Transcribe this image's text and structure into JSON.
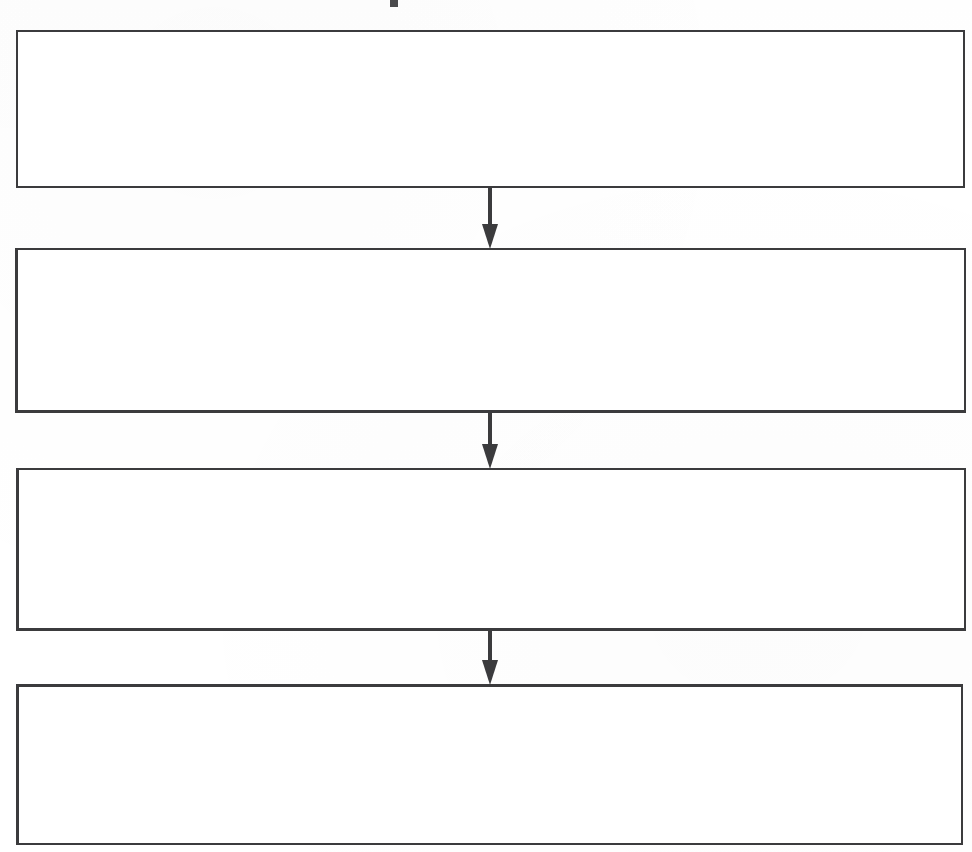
{
  "document": {
    "kind": "flowchart",
    "title": "",
    "orientation": "vertical",
    "background_color": "#ffffff",
    "line_color": "#3b3b3d",
    "node_fill": "#ffffff",
    "page_width": 972,
    "page_height": 852
  },
  "title_fragment": {
    "name": "clipped-title-glyph",
    "text": "",
    "note": "truncated dark glyph fragment at top edge",
    "x": 390,
    "y": 0,
    "width": 8,
    "height": 7,
    "color": "#4a4a4c"
  },
  "flowchart": {
    "node_count": 4,
    "connector_count": 3,
    "nodes": [
      {
        "id": "node-1",
        "name": "process-box-1",
        "label": "",
        "order": 1,
        "x": 16,
        "y": 30,
        "width": 949,
        "height": 158
      },
      {
        "id": "node-2",
        "name": "process-box-2",
        "label": "",
        "order": 2,
        "x": 15,
        "y": 248,
        "width": 951,
        "height": 165
      },
      {
        "id": "node-3",
        "name": "process-box-3",
        "label": "",
        "order": 3,
        "x": 16,
        "y": 468,
        "width": 950,
        "height": 163
      },
      {
        "id": "node-4",
        "name": "process-box-4",
        "label": "",
        "order": 4,
        "x": 16,
        "y": 684,
        "width": 947,
        "height": 161
      }
    ],
    "connectors": [
      {
        "id": "connector-1",
        "name": "arrow-node1-to-node2",
        "from": "node-1",
        "to": "node-2",
        "label": "",
        "direction": "down",
        "x": 481,
        "y": 187,
        "width": 18,
        "height": 62,
        "shaft_width": 4,
        "head_width": 16,
        "head_height": 25
      },
      {
        "id": "connector-2",
        "name": "arrow-node2-to-node3",
        "from": "node-2",
        "to": "node-3",
        "label": "",
        "direction": "down",
        "x": 481,
        "y": 412,
        "width": 18,
        "height": 57,
        "shaft_width": 4,
        "head_width": 16,
        "head_height": 25
      },
      {
        "id": "connector-3",
        "name": "arrow-node3-to-node4",
        "from": "node-3",
        "to": "node-4",
        "label": "",
        "direction": "down",
        "x": 481,
        "y": 630,
        "width": 18,
        "height": 55,
        "shaft_width": 4,
        "head_width": 16,
        "head_height": 25
      }
    ]
  }
}
